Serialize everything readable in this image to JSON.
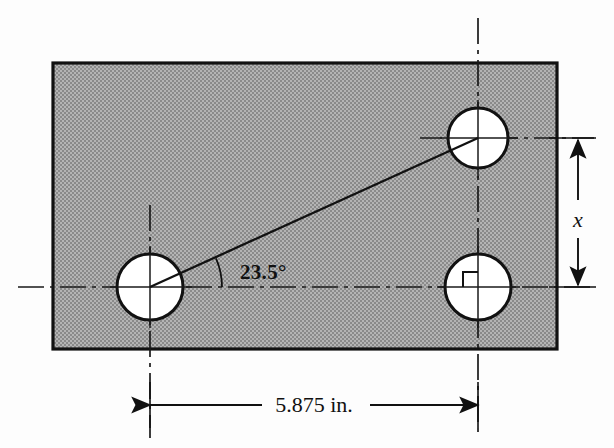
{
  "figure": {
    "type": "engineering-drawing",
    "colors": {
      "plate_fill": "#a8a8a8",
      "stipple_dot": "#7d7d7d",
      "outline": "#111111",
      "hole_fill": "#ffffff",
      "centerline": "#1a1a1a",
      "background": "#fdfdfd"
    },
    "plate": {
      "name": "rectangular-plate",
      "x": 53,
      "y": 63,
      "width": 504,
      "height": 286
    },
    "holes": [
      {
        "name": "left-hole",
        "cx": 150,
        "cy": 287,
        "r": 33
      },
      {
        "name": "top-right-hole",
        "cx": 478,
        "cy": 138,
        "r": 30
      },
      {
        "name": "bottom-right-hole",
        "cx": 478,
        "cy": 287,
        "r": 33
      }
    ],
    "angle": {
      "value": "23.5°",
      "degrees": 23.5,
      "vertex": {
        "x": 150,
        "y": 287
      },
      "arc_radius": 72,
      "label_x": 240,
      "label_y": 279
    },
    "linear_dimension": {
      "value": "5.875 in.",
      "number": 5.875,
      "units": "in.",
      "from_x": 150,
      "to_x": 478,
      "y": 405,
      "label_x": 314,
      "label_y": 401
    },
    "vertical_dimension": {
      "value": "x",
      "from_y": 138,
      "to_y": 287,
      "x": 578,
      "label_x": 589,
      "label_y": 220
    },
    "right_angle_marker": {
      "name": "right-angle-symbol",
      "cx": 478,
      "cy": 287,
      "size": 15
    },
    "hypotenuse": {
      "name": "center-to-center-line",
      "x1": 150,
      "y1": 287,
      "x2": 478,
      "y2": 138
    }
  }
}
